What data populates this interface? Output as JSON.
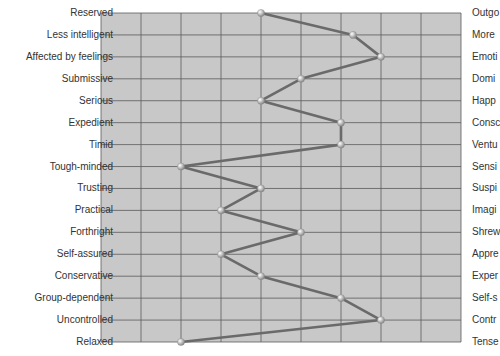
{
  "chart_data": {
    "type": "line",
    "title": "",
    "xlabel": "",
    "ylabel": "",
    "xlim": [
      1,
      10
    ],
    "grid": true,
    "orientation": "horizontal-profile",
    "left_labels": [
      "Reserved",
      "Less intelligent",
      "Affected by feelings",
      "Submissive",
      "Serious",
      "Expedient",
      "Timid",
      "Tough-minded",
      "Trusting",
      "Practical",
      "Forthright",
      "Self-assured",
      "Conservative",
      "Group-dependent",
      "Uncontrolled",
      "Relaxed"
    ],
    "right_labels": [
      "Outgo",
      "More",
      "Emoti",
      "Domi",
      "Happ",
      "Consc",
      "Ventu",
      "Sensi",
      "Suspi",
      "Imagi",
      "Shrew",
      "Appre",
      "Exper",
      "Self-s",
      "Contr",
      "Tense"
    ],
    "series": [
      {
        "name": "Profile",
        "values": [
          5,
          7.3,
          8,
          6,
          5,
          7,
          7,
          3,
          5,
          4,
          6,
          4,
          5,
          7,
          8,
          3
        ]
      }
    ],
    "colors": {
      "grid_fill": "#c8c8c8",
      "grid_line": "#5a5a5a",
      "line": "#6a6a6a",
      "marker": "#d8d8d8"
    }
  }
}
